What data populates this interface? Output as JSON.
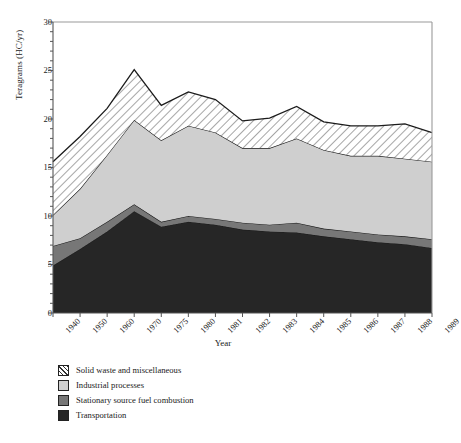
{
  "figure": {
    "ylabel": "Teragrams (HC/yr)",
    "xlabel": "Year"
  },
  "chart_data": {
    "type": "area",
    "title": "",
    "xlabel": "Year",
    "ylabel": "Teragrams (HC/yr)",
    "ylim": [
      0,
      30
    ],
    "yticks": [
      0,
      5,
      10,
      15,
      20,
      25,
      30
    ],
    "grid": false,
    "stacked": true,
    "legend_position": "below-axes-left",
    "categories": [
      "1940",
      "1950",
      "1960",
      "1970",
      "1975",
      "1980",
      "1981",
      "1982",
      "1983",
      "1984",
      "1985",
      "1986",
      "1987",
      "1988",
      "1989"
    ],
    "series": [
      {
        "name": "Transportation",
        "color": "#262626",
        "values": [
          4.9,
          6.6,
          8.4,
          10.5,
          8.9,
          9.4,
          9.1,
          8.6,
          8.4,
          8.3,
          7.9,
          7.6,
          7.3,
          7.1,
          6.7
        ]
      },
      {
        "name": "Stationary source fuel combustion",
        "color": "#777777",
        "values": [
          2.0,
          1.1,
          1.0,
          0.7,
          0.5,
          0.6,
          0.6,
          0.7,
          0.7,
          1.0,
          0.8,
          0.8,
          0.8,
          0.8,
          0.9
        ]
      },
      {
        "name": "Industrial processes",
        "color": "#cfcfcf",
        "values": [
          3.2,
          5.1,
          6.9,
          8.7,
          8.4,
          9.3,
          8.9,
          7.7,
          7.9,
          8.7,
          8.1,
          7.8,
          8.1,
          8.0,
          8.0
        ]
      },
      {
        "name": "Solid waste and miscellaneous",
        "color": "#ffffff",
        "pattern": "diagonal-hatch",
        "values": [
          5.5,
          5.4,
          4.8,
          5.2,
          3.6,
          3.5,
          3.4,
          2.8,
          3.1,
          3.3,
          2.9,
          3.1,
          3.1,
          3.6,
          3.0
        ]
      }
    ],
    "cumulative_totals": [
      15.6,
      18.2,
      21.1,
      25.1,
      21.4,
      22.8,
      22.0,
      19.8,
      20.1,
      21.3,
      19.7,
      19.3,
      19.3,
      19.5,
      18.6
    ]
  },
  "legend": {
    "items": [
      {
        "label": "Solid waste and miscellaneous",
        "swatch": "hatch"
      },
      {
        "label": "Industrial processes",
        "swatch": "light-gray"
      },
      {
        "label": "Stationary source fuel combustion",
        "swatch": "mid-gray"
      },
      {
        "label": "Transportation",
        "swatch": "dark-gray"
      }
    ]
  }
}
